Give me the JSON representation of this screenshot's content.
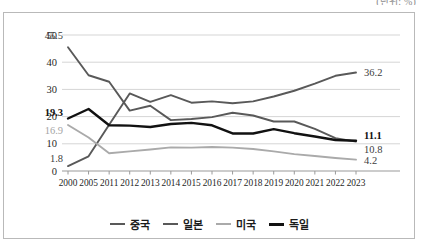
{
  "unit_caption": "(단위: %)",
  "chart_data": {
    "type": "line",
    "title": "",
    "subtitle": "",
    "xlabel": "",
    "ylabel": "",
    "unit": "(단위: %)",
    "categories": [
      "2000",
      "2005",
      "2011",
      "2012",
      "2013",
      "2014",
      "2015",
      "2016",
      "2017",
      "2018",
      "2019",
      "2020",
      "2021",
      "2022",
      "2023"
    ],
    "ylim": [
      0,
      50
    ],
    "yticks": [
      0,
      10,
      20,
      30,
      40,
      50
    ],
    "grid": true,
    "legend_position": "bottom",
    "series": [
      {
        "name": "중국",
        "color": "#595959",
        "width": 1.9,
        "values": [
          1.8,
          5.4,
          17.0,
          28.5,
          25.4,
          27.9,
          25.1,
          25.6,
          24.9,
          25.6,
          27.4,
          29.5,
          32.1,
          35.0,
          36.2
        ],
        "start_label": "1.8",
        "end_label": "36.2"
      },
      {
        "name": "일본",
        "color": "#595959",
        "width": 1.9,
        "values": [
          45.5,
          35.2,
          32.8,
          22.2,
          24.0,
          18.7,
          19.1,
          19.8,
          21.4,
          20.4,
          18.2,
          18.2,
          15.5,
          12.1,
          10.8
        ],
        "start_label": "45.5",
        "end_label": "10.8"
      },
      {
        "name": "미국",
        "color": "#aaaaaa",
        "width": 1.9,
        "values": [
          16.9,
          12.3,
          6.5,
          7.2,
          7.9,
          8.7,
          8.6,
          8.8,
          8.6,
          8.1,
          7.2,
          6.2,
          5.5,
          4.8,
          4.2
        ],
        "start_label": "16.9",
        "end_label": "4.2"
      },
      {
        "name": "독일",
        "color": "#111111",
        "width": 2.4,
        "values": [
          19.3,
          22.8,
          16.8,
          16.7,
          16.2,
          17.3,
          17.7,
          16.8,
          13.8,
          13.8,
          15.4,
          13.9,
          12.7,
          11.4,
          11.1
        ],
        "start_label": "19.3",
        "end_label": "11.1"
      }
    ],
    "start_labels": [
      {
        "text": "45.5",
        "series": "일본",
        "color": "#3d3d3d"
      },
      {
        "text": "19.3",
        "series": "독일",
        "color": "#111111"
      },
      {
        "text": "16.9",
        "series": "미국",
        "color": "#a5a5a5"
      },
      {
        "text": "1.8",
        "series": "중국",
        "color": "#3d3d3d"
      }
    ],
    "end_labels": [
      {
        "text": "36.2",
        "series": "중국",
        "color": "#3d3d3d"
      },
      {
        "text": "11.1",
        "series": "독일",
        "color": "#111111"
      },
      {
        "text": "10.8",
        "series": "일본",
        "color": "#3d3d3d"
      },
      {
        "text": "4.2",
        "series": "미국",
        "color": "#3d3d3d"
      }
    ]
  },
  "legend": {
    "items": [
      {
        "label": "중국",
        "color": "#595959",
        "width": 2.2
      },
      {
        "label": "일본",
        "color": "#595959",
        "width": 2.2
      },
      {
        "label": "미국",
        "color": "#aaaaaa",
        "width": 2.2
      },
      {
        "label": "독일",
        "color": "#111111",
        "width": 3.0
      }
    ]
  },
  "axes": {
    "y_tick_labels": [
      "50",
      "40",
      "30",
      "20",
      "10",
      "0"
    ],
    "x_tick_labels": [
      "2000",
      "2005",
      "2011",
      "2012",
      "2013",
      "2014",
      "2015",
      "2016",
      "2017",
      "2018",
      "2019",
      "2020",
      "2021",
      "2022",
      "2023"
    ]
  }
}
